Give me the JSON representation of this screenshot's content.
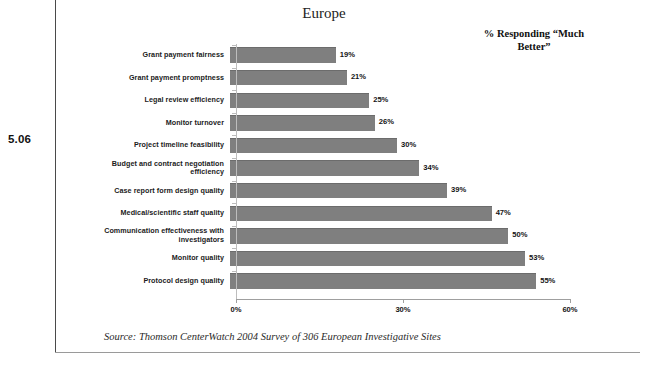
{
  "figure": {
    "number": "5.06"
  },
  "legend": {
    "note_line1": "% Responding “Much",
    "note_line2": "Better”"
  },
  "source": {
    "text": "Source:  Thomson CenterWatch 2004 Survey of 306 European Investigative Sites"
  },
  "chart_data": {
    "type": "bar",
    "orientation": "horizontal",
    "title": "Europe",
    "xlabel": "",
    "ylabel": "",
    "xlim": [
      0,
      60
    ],
    "grid": false,
    "legend_position": "top-right",
    "annotations": [
      "% Responding “Much Better”"
    ],
    "tick_labels": [
      "0%",
      "30%",
      "60%"
    ],
    "ticks": [
      0,
      30,
      60
    ],
    "categories": [
      "Grant payment fairness",
      "Grant payment promptness",
      "Legal review efficiency",
      "Monitor turnover",
      "Project timeline feasibility",
      "Budget and contract negotiation efficiency",
      "Case report form design quality",
      "Medical/scientific staff quality",
      "Communication effectiveness with investigators",
      "Monitor quality",
      "Protocol design quality"
    ],
    "values": [
      19,
      21,
      25,
      26,
      30,
      34,
      39,
      47,
      50,
      53,
      55
    ],
    "value_labels": [
      "19%",
      "21%",
      "25%",
      "26%",
      "30%",
      "34%",
      "39%",
      "47%",
      "50%",
      "53%",
      "55%"
    ],
    "bar_color": "#7f7f7f",
    "axis_color": "#9f9f9f"
  }
}
